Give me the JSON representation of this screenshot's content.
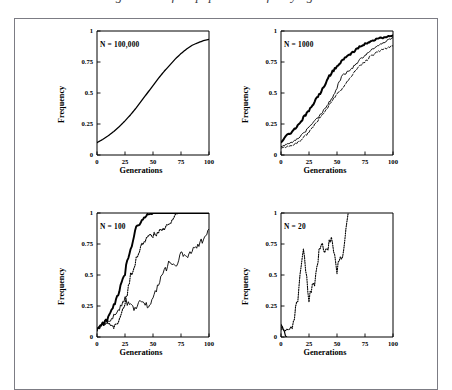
{
  "figure": {
    "title_partial": "genetic drift in populations of varying size",
    "border_color": "#7c7c84",
    "axis_color": "#000000",
    "background": "#ffffff"
  },
  "axes": {
    "xlabel": "Generations",
    "ylabel": "Frequency",
    "xticks": [
      "0",
      "25",
      "50",
      "75",
      "100"
    ],
    "yticks": [
      "0",
      "0.25",
      "0.5",
      "0.75",
      "1"
    ],
    "xlim": [
      0,
      100
    ],
    "ylim": [
      0,
      1
    ]
  },
  "panels": [
    {
      "id": "panel-n-100000",
      "label": "N = 100,000"
    },
    {
      "id": "panel-n-1000",
      "label": "N = 1000"
    },
    {
      "id": "panel-n-100",
      "label": "N = 100"
    },
    {
      "id": "panel-n-20",
      "label": "N = 20"
    }
  ],
  "chart_data": [
    {
      "type": "line",
      "title": "N = 100,000",
      "xlabel": "Generations",
      "ylabel": "Frequency",
      "xlim": [
        0,
        100
      ],
      "ylim": [
        0,
        1
      ],
      "grid": false,
      "legend": "none",
      "x": [
        0,
        5,
        10,
        15,
        20,
        25,
        30,
        35,
        40,
        45,
        50,
        55,
        60,
        65,
        70,
        75,
        80,
        85,
        90,
        95,
        100
      ],
      "series": [
        {
          "name": "deterministic selection trajectory",
          "style": "solid",
          "width": 1.3,
          "values": [
            0.1,
            0.125,
            0.155,
            0.19,
            0.23,
            0.275,
            0.325,
            0.38,
            0.44,
            0.5,
            0.56,
            0.62,
            0.675,
            0.725,
            0.775,
            0.818,
            0.855,
            0.885,
            0.905,
            0.922,
            0.932
          ]
        }
      ]
    },
    {
      "type": "line",
      "title": "N = 1000",
      "xlabel": "Generations",
      "ylabel": "Frequency",
      "xlim": [
        0,
        100
      ],
      "ylim": [
        0,
        1
      ],
      "grid": false,
      "legend": "none",
      "x": [
        0,
        5,
        10,
        15,
        20,
        25,
        30,
        35,
        40,
        45,
        50,
        55,
        60,
        65,
        70,
        75,
        80,
        85,
        90,
        95,
        100
      ],
      "series": [
        {
          "name": "replicate 1",
          "style": "solid",
          "width": 2.0,
          "values": [
            0.105,
            0.16,
            0.185,
            0.24,
            0.3,
            0.355,
            0.43,
            0.5,
            0.585,
            0.665,
            0.715,
            0.765,
            0.8,
            0.835,
            0.875,
            0.895,
            0.915,
            0.935,
            0.945,
            0.955,
            0.965
          ]
        },
        {
          "name": "replicate 2",
          "style": "solid",
          "width": 0.9,
          "values": [
            0.065,
            0.085,
            0.105,
            0.135,
            0.175,
            0.22,
            0.275,
            0.325,
            0.385,
            0.45,
            0.545,
            0.645,
            0.675,
            0.715,
            0.765,
            0.805,
            0.845,
            0.875,
            0.9,
            0.925,
            0.945
          ]
        },
        {
          "name": "replicate 3",
          "style": "dashed",
          "width": 0.9,
          "values": [
            0.055,
            0.065,
            0.08,
            0.1,
            0.14,
            0.185,
            0.245,
            0.305,
            0.365,
            0.43,
            0.49,
            0.545,
            0.6,
            0.665,
            0.715,
            0.755,
            0.795,
            0.825,
            0.85,
            0.865,
            0.88
          ]
        }
      ]
    },
    {
      "type": "line",
      "title": "N = 100",
      "xlabel": "Generations",
      "ylabel": "Frequency",
      "xlim": [
        0,
        100
      ],
      "ylim": [
        0,
        1
      ],
      "grid": false,
      "legend": "none",
      "x": [
        0,
        5,
        10,
        15,
        20,
        25,
        30,
        35,
        40,
        45,
        50,
        55,
        60,
        65,
        70,
        75,
        80,
        85,
        90,
        95,
        100
      ],
      "series": [
        {
          "name": "replicate 1 (fixes at generation ~48)",
          "style": "solid",
          "width": 1.9,
          "values": [
            0.07,
            0.11,
            0.15,
            0.26,
            0.36,
            0.52,
            0.7,
            0.895,
            0.935,
            0.985,
            1.0,
            1.0,
            1.0,
            1.0,
            1.0,
            1.0,
            1.0,
            1.0,
            1.0,
            1.0,
            1.0
          ]
        },
        {
          "name": "replicate 2 (fixes at generation ~72)",
          "style": "dotted",
          "width": 1.1,
          "values": [
            0.06,
            0.1,
            0.12,
            0.075,
            0.145,
            0.26,
            0.5,
            0.62,
            0.735,
            0.8,
            0.82,
            0.845,
            0.875,
            0.915,
            0.985,
            1.0,
            1.0,
            1.0,
            1.0,
            1.0,
            1.0
          ]
        },
        {
          "name": "replicate 3 (drifting, ends ~0.87)",
          "style": "solid",
          "width": 0.9,
          "values": [
            0.055,
            0.095,
            0.135,
            0.165,
            0.22,
            0.3,
            0.245,
            0.225,
            0.305,
            0.245,
            0.31,
            0.43,
            0.52,
            0.615,
            0.555,
            0.665,
            0.635,
            0.7,
            0.745,
            0.785,
            0.87
          ]
        }
      ]
    },
    {
      "type": "line",
      "title": "N = 20",
      "xlabel": "Generations",
      "ylabel": "Frequency",
      "xlim": [
        0,
        100
      ],
      "ylim": [
        0,
        1
      ],
      "grid": false,
      "legend": "none",
      "x": [
        0,
        5,
        10,
        15,
        20,
        25,
        30,
        35,
        40,
        45,
        50,
        55,
        60,
        65,
        70,
        75,
        80,
        85,
        90,
        95,
        100
      ],
      "series": [
        {
          "name": "replicate 1 (lost at generation ~5)",
          "style": "solid",
          "width": 1.2,
          "values": [
            0.1,
            0.0,
            null,
            null,
            null,
            null,
            null,
            null,
            null,
            null,
            null,
            null,
            null,
            null,
            null,
            null,
            null,
            null,
            null,
            null,
            null
          ]
        },
        {
          "name": "replicate 2 (fixes at generation ~60)",
          "style": "dotted",
          "width": 1.1,
          "values": [
            0.075,
            0.05,
            0.085,
            0.3,
            0.73,
            0.3,
            0.45,
            0.735,
            0.7,
            0.8,
            0.545,
            0.665,
            1.0,
            null,
            null,
            null,
            null,
            null,
            null,
            null,
            null
          ]
        }
      ]
    }
  ]
}
